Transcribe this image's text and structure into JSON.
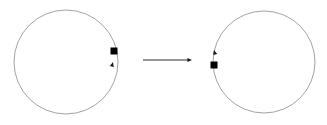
{
  "figure": {
    "title": "",
    "background_color": "#ffffff",
    "width": 327,
    "height": 125
  },
  "diagram_data": {
    "type": "diagram",
    "description": "Two circles connected by a rightward transformation arrow; each circle carries a black square marker and a small arrowhead indicating the traversal direction",
    "stroke_color": "#8c8c8c",
    "marker_color": "#000000",
    "arrow_color": "#1a1a1a",
    "shapes": [
      {
        "name": "left-circle",
        "kind": "circle",
        "cx": 66,
        "cy": 62,
        "r": 52,
        "stroke": "#8c8c8c",
        "stroke_width": 0.8,
        "fill": "none"
      },
      {
        "name": "right-circle",
        "kind": "circle",
        "cx": 264,
        "cy": 62,
        "r": 51,
        "stroke": "#8c8c8c",
        "stroke_width": 0.8,
        "fill": "none"
      }
    ],
    "markers": [
      {
        "name": "left-circle-square-marker",
        "kind": "square",
        "cx": 114,
        "cy": 51,
        "size": 7,
        "fill": "#000000",
        "position_label": "right side of left circle"
      },
      {
        "name": "right-circle-square-marker",
        "kind": "square",
        "cx": 214,
        "cy": 65,
        "size": 7,
        "fill": "#000000",
        "position_label": "left side of right circle"
      }
    ],
    "direction_arrowheads": [
      {
        "name": "left-circle-direction-arrowhead",
        "tip_x": 113,
        "tip_y": 62,
        "angle_deg": -75,
        "size": 5,
        "fill": "#1a1a1a",
        "direction_label": "counterclockwise"
      },
      {
        "name": "right-circle-direction-arrowhead",
        "tip_x": 214,
        "tip_y": 50,
        "angle_deg": -105,
        "size": 5,
        "fill": "#1a1a1a",
        "direction_label": "clockwise"
      }
    ],
    "connector": {
      "name": "transformation-arrow",
      "kind": "arrow",
      "x1": 143,
      "y1": 60,
      "x2": 192,
      "y2": 60,
      "stroke": "#1a1a1a",
      "stroke_width": 0.9,
      "head_size": 5,
      "direction": "right",
      "label": ""
    },
    "labels": []
  }
}
